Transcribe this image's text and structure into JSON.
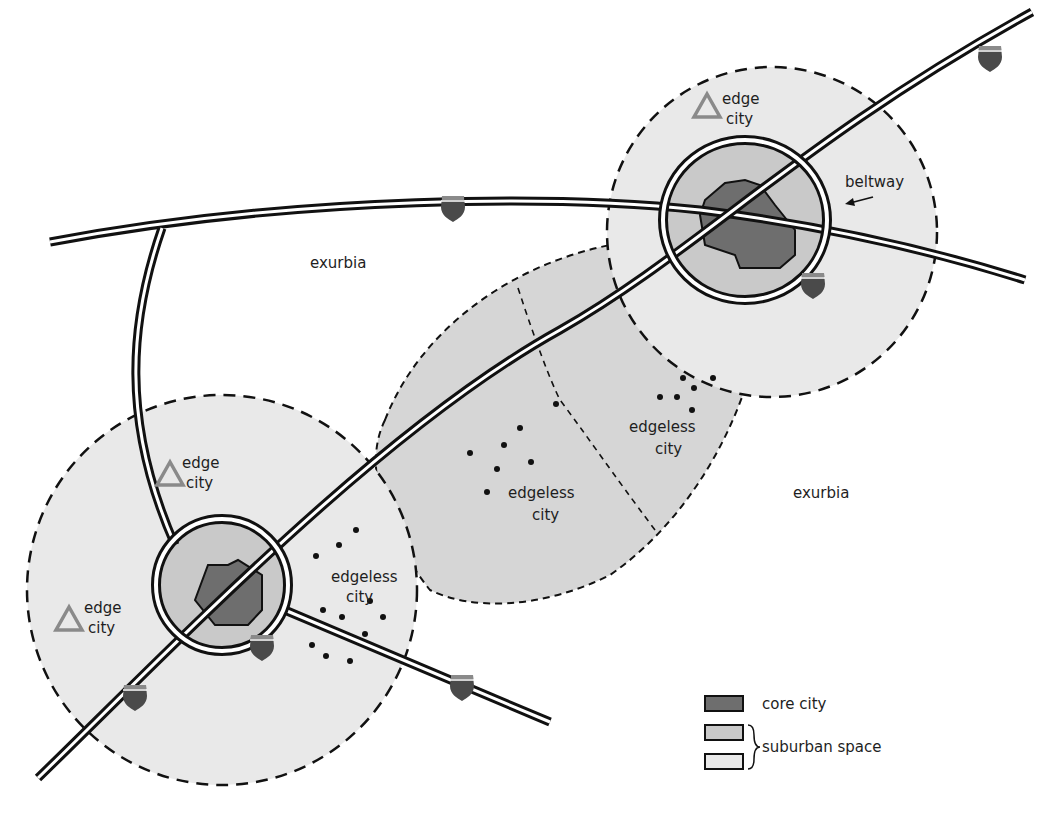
{
  "colors": {
    "core": "#6e6e6e",
    "inner_suburb": "#c9c9c9",
    "outer_suburb": "#e9e9e9",
    "edgeless_zone": "#d6d6d6",
    "edge_triangle": "#8a8a8a",
    "shield": "#4a4a4a",
    "line": "#111111"
  },
  "labels": {
    "exurbia_1": "exurbia",
    "exurbia_2": "exurbia",
    "beltway": "beltway",
    "edge": "edge",
    "city": "city",
    "edgeless": "edgeless"
  },
  "edge_cities": [
    {
      "id": "ne",
      "line1": "edge",
      "line2": "city"
    },
    {
      "id": "sw-upper",
      "line1": "edge",
      "line2": "city"
    },
    {
      "id": "sw-lower",
      "line1": "edge",
      "line2": "city"
    }
  ],
  "edgeless_cities": [
    {
      "id": "sw",
      "line1": "edgeless",
      "line2": "city"
    },
    {
      "id": "middle",
      "line1": "edgeless",
      "line2": "city"
    },
    {
      "id": "east",
      "line1": "edgeless",
      "line2": "city"
    }
  ],
  "legend": {
    "items": [
      {
        "label": "core city",
        "swatch": "core"
      },
      {
        "label": "suburban space",
        "swatch": "inner_suburb+outer_suburb"
      }
    ]
  }
}
